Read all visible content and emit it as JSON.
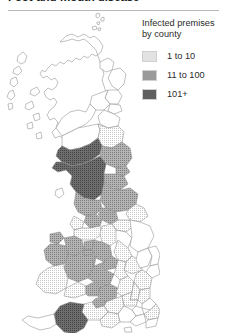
{
  "figure": {
    "title": "Foot-and-mouth disease",
    "title_visible_fragment": "mouth disease"
  },
  "legend": {
    "title_line1": "Infected premises",
    "title_line2": "by county",
    "items": [
      {
        "label": "1 to 10",
        "color": "#e2e2e2"
      },
      {
        "label": "11 to 100",
        "color": "#9a9a9a"
      },
      {
        "label": "101+",
        "color": "#5f5f5f"
      }
    ]
  },
  "map": {
    "region": "Great Britain",
    "outline_color": "#8c8c8c",
    "background": "#ffffff",
    "class_colors": {
      "none": "#ffffff",
      "low": "#e2e2e2",
      "medium": "#9a9a9a",
      "high": "#5f5f5f"
    },
    "areas": [
      {
        "name": "Shetland",
        "class": "none"
      },
      {
        "name": "Orkney",
        "class": "none"
      },
      {
        "name": "Outer Hebrides",
        "class": "none"
      },
      {
        "name": "Highland",
        "class": "none"
      },
      {
        "name": "Moray",
        "class": "none"
      },
      {
        "name": "Aberdeenshire",
        "class": "none"
      },
      {
        "name": "Angus",
        "class": "none"
      },
      {
        "name": "Perth and Kinross",
        "class": "none"
      },
      {
        "name": "Argyll and Bute",
        "class": "none"
      },
      {
        "name": "Fife",
        "class": "none"
      },
      {
        "name": "Lothian",
        "class": "none"
      },
      {
        "name": "Strathclyde",
        "class": "none"
      },
      {
        "name": "Borders",
        "class": "low"
      },
      {
        "name": "Dumfries and Galloway",
        "class": "high"
      },
      {
        "name": "Cumbria",
        "class": "high"
      },
      {
        "name": "Northumberland",
        "class": "medium"
      },
      {
        "name": "Durham",
        "class": "medium"
      },
      {
        "name": "Tyne and Wear",
        "class": "medium"
      },
      {
        "name": "North Yorkshire",
        "class": "medium"
      },
      {
        "name": "Lancashire",
        "class": "medium"
      },
      {
        "name": "Isle of Man",
        "class": "none"
      },
      {
        "name": "Greater Manchester",
        "class": "medium"
      },
      {
        "name": "Merseyside",
        "class": "low"
      },
      {
        "name": "Cheshire",
        "class": "low"
      },
      {
        "name": "West Yorkshire",
        "class": "medium"
      },
      {
        "name": "South Yorkshire",
        "class": "low"
      },
      {
        "name": "Humberside",
        "class": "low"
      },
      {
        "name": "Lincolnshire",
        "class": "none"
      },
      {
        "name": "Derbyshire",
        "class": "low"
      },
      {
        "name": "Nottinghamshire",
        "class": "none"
      },
      {
        "name": "Staffordshire",
        "class": "medium"
      },
      {
        "name": "Shropshire",
        "class": "medium"
      },
      {
        "name": "Anglesey",
        "class": "medium"
      },
      {
        "name": "Gwynedd",
        "class": "medium"
      },
      {
        "name": "Clwyd",
        "class": "medium"
      },
      {
        "name": "Powys",
        "class": "medium"
      },
      {
        "name": "Dyfed",
        "class": "low"
      },
      {
        "name": "Glamorgan",
        "class": "low"
      },
      {
        "name": "Gwent",
        "class": "medium"
      },
      {
        "name": "Hereford and Worcester",
        "class": "medium"
      },
      {
        "name": "Warwickshire",
        "class": "low"
      },
      {
        "name": "West Midlands",
        "class": "medium"
      },
      {
        "name": "Leicestershire",
        "class": "low"
      },
      {
        "name": "Northamptonshire",
        "class": "low"
      },
      {
        "name": "Cambridgeshire",
        "class": "none"
      },
      {
        "name": "Norfolk",
        "class": "none"
      },
      {
        "name": "Suffolk",
        "class": "none"
      },
      {
        "name": "Essex",
        "class": "low"
      },
      {
        "name": "Gloucestershire",
        "class": "medium"
      },
      {
        "name": "Oxfordshire",
        "class": "low"
      },
      {
        "name": "Buckinghamshire",
        "class": "low"
      },
      {
        "name": "Hertfordshire",
        "class": "low"
      },
      {
        "name": "Greater London",
        "class": "none"
      },
      {
        "name": "Kent",
        "class": "low"
      },
      {
        "name": "Surrey",
        "class": "none"
      },
      {
        "name": "Berkshire",
        "class": "low"
      },
      {
        "name": "Wiltshire",
        "class": "low"
      },
      {
        "name": "Avon",
        "class": "medium"
      },
      {
        "name": "Somerset",
        "class": "low"
      },
      {
        "name": "Dorset",
        "class": "low"
      },
      {
        "name": "Hampshire",
        "class": "none"
      },
      {
        "name": "West Sussex",
        "class": "none"
      },
      {
        "name": "East Sussex",
        "class": "none"
      },
      {
        "name": "Isle of Wight",
        "class": "none"
      },
      {
        "name": "Devon",
        "class": "high"
      },
      {
        "name": "Cornwall",
        "class": "none"
      }
    ]
  }
}
